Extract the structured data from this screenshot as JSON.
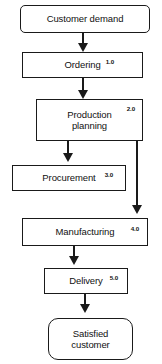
{
  "diagram": {
    "background_color": "#ffffff",
    "line_color": "#1a1a1a",
    "nodes": [
      {
        "id": "customer-demand",
        "label": "Customer demand",
        "code": "",
        "shape": "rounded-rect"
      },
      {
        "id": "ordering",
        "label": "Ordering",
        "code": "1.0",
        "shape": "rect"
      },
      {
        "id": "production",
        "label": "Production\nplanning",
        "code": "2.0",
        "shape": "rect"
      },
      {
        "id": "procurement",
        "label": "Procurement",
        "code": "3.0",
        "shape": "rect"
      },
      {
        "id": "manufacturing",
        "label": "Manufacturing",
        "code": "4.0",
        "shape": "rect"
      },
      {
        "id": "delivery",
        "label": "Delivery",
        "code": "5.0",
        "shape": "rect"
      },
      {
        "id": "satisfied",
        "label": "Satisfied\ncustomer",
        "code": "",
        "shape": "rounded-rect"
      }
    ],
    "connectors": [
      {
        "id": "c1",
        "from": "customer-demand",
        "to": "ordering",
        "arrow": "down-arrow-icon"
      },
      {
        "id": "c2",
        "from": "ordering",
        "to": "production",
        "arrow": "down-arrow-icon"
      },
      {
        "id": "c3",
        "from": "production",
        "to": "procurement",
        "arrow": "down-arrow-icon"
      },
      {
        "id": "c4",
        "from": "production",
        "to": "manufacturing",
        "arrow": "down-arrow-icon"
      },
      {
        "id": "c5",
        "from": "manufacturing",
        "to": "delivery",
        "arrow": "down-arrow-icon"
      },
      {
        "id": "c6",
        "from": "delivery",
        "to": "satisfied",
        "arrow": "down-arrow-icon"
      }
    ]
  }
}
